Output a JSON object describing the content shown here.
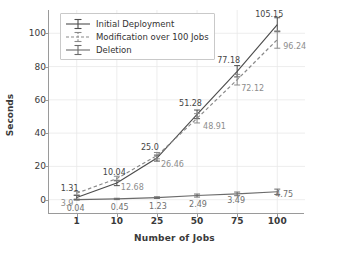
{
  "chart_data": {
    "type": "line",
    "title": "",
    "xlabel": "Number of Jobs",
    "ylabel": "Seconds",
    "categories": [
      "1",
      "10",
      "25",
      "50",
      "75",
      "100"
    ],
    "x": [
      1,
      10,
      25,
      50,
      75,
      100
    ],
    "ylim": [
      -8,
      114
    ],
    "yticks": [
      0,
      20,
      40,
      60,
      80,
      100
    ],
    "grid": true,
    "legend_position": "upper left",
    "error_bars": true,
    "series": [
      {
        "name": "Initial Deployment",
        "style": "solid",
        "color": "#4d4d4d",
        "values": [
          1.31,
          10.04,
          25.0,
          51.28,
          77.18,
          105.15
        ],
        "labels": [
          "1.31",
          "10.04",
          "25.0",
          "51.28",
          "77.18",
          "105.15"
        ],
        "errors": [
          1.2,
          1.6,
          1.8,
          2.6,
          3.4,
          4.2
        ]
      },
      {
        "name": "Modification over 100 Jobs",
        "style": "dashed",
        "color": "#8a8a8a",
        "values": [
          3.9,
          12.68,
          26.46,
          48.91,
          72.12,
          96.24
        ],
        "labels": [
          "3.9",
          "12.68",
          "26.46",
          "48.91",
          "72.12",
          "96.24"
        ],
        "errors": [
          1.0,
          1.4,
          1.9,
          2.8,
          3.2,
          5.2
        ]
      },
      {
        "name": "Deletion",
        "style": "solid",
        "color": "#6b6b6b",
        "values": [
          0.04,
          0.45,
          1.23,
          2.49,
          3.49,
          4.75
        ],
        "labels": [
          "0.04",
          "0.45",
          "1.23",
          "2.49",
          "3.49",
          "4.75"
        ],
        "errors": [
          0.3,
          0.4,
          0.5,
          0.9,
          1.1,
          1.6
        ]
      }
    ]
  },
  "legend": {
    "items": [
      {
        "label": "Initial Deployment"
      },
      {
        "label": "Modification over 100 Jobs"
      },
      {
        "label": "Deletion"
      }
    ]
  },
  "axes": {
    "y_tick_labels": [
      "0",
      "20",
      "40",
      "60",
      "80",
      "100"
    ],
    "x_tick_labels": [
      "1",
      "10",
      "25",
      "50",
      "75",
      "100"
    ]
  },
  "style": {
    "grid_color": "#e8e8e8",
    "axis_color": "#9a9a9a",
    "background": "#ffffff"
  }
}
